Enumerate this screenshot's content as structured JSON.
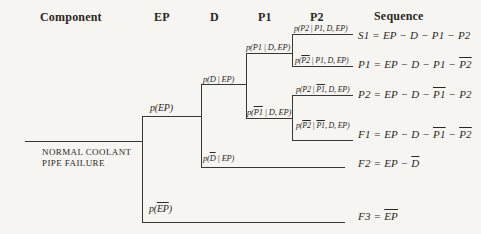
{
  "colors": {
    "background": "#f6f5f1",
    "ink": "#2b2824",
    "line": "#3a3731"
  },
  "headers": {
    "component": "Component",
    "ep": "EP",
    "d": "D",
    "p1": "P1",
    "p2": "P2",
    "sequence": "Sequence"
  },
  "root_event": {
    "line1": "NORMAL COOLANT",
    "line2": "PIPE FAILURE"
  },
  "branch_labels": {
    "ep": [
      {
        "t": "p(EP)"
      }
    ],
    "d": [
      {
        "t": "p(D | EP)"
      }
    ],
    "p1": [
      {
        "t": "p(P1 | D, EP)"
      }
    ],
    "p2_given_p1": [
      {
        "t": "p(P2 | P1, D, EP)"
      }
    ],
    "p2bar_given_p1": [
      {
        "t": "p("
      },
      {
        "t": "P2",
        "o": 1
      },
      {
        "t": " | P1, D, EP)"
      }
    ],
    "p2_given_p1bar": [
      {
        "t": "p(P2 | "
      },
      {
        "t": "P1",
        "o": 1
      },
      {
        "t": ", D, EP)"
      }
    ],
    "p2bar_given_p1bar": [
      {
        "t": "p("
      },
      {
        "t": "P2",
        "o": 1
      },
      {
        "t": " | "
      },
      {
        "t": "P1",
        "o": 1
      },
      {
        "t": ", D, EP)"
      }
    ],
    "p1bar": [
      {
        "t": "p("
      },
      {
        "t": "P1",
        "o": 1
      },
      {
        "t": " | D, EP)"
      }
    ],
    "dbar": [
      {
        "t": "p("
      },
      {
        "t": "D",
        "o": 1
      },
      {
        "t": " | EP)"
      }
    ],
    "epbar": [
      {
        "t": "p("
      },
      {
        "t": "EP",
        "o": 1
      },
      {
        "t": ")"
      }
    ]
  },
  "sequences": {
    "s1": [
      {
        "t": "S1 = EP − D − P1 − P2"
      }
    ],
    "p1": [
      {
        "t": "P1 = EP − D − P1 − "
      },
      {
        "t": "P2",
        "o": 1
      }
    ],
    "p2": [
      {
        "t": "P2 = EP − D − "
      },
      {
        "t": "P1",
        "o": 1
      },
      {
        "t": " − P2"
      }
    ],
    "f1": [
      {
        "t": "F1 = EP − D − "
      },
      {
        "t": "P1",
        "o": 1
      },
      {
        "t": " − "
      },
      {
        "t": "P2",
        "o": 1
      }
    ],
    "f2": [
      {
        "t": "F2 = EP − "
      },
      {
        "t": "D",
        "o": 1
      }
    ],
    "f3": [
      {
        "t": "F3 = "
      },
      {
        "t": "EP",
        "o": 1
      }
    ]
  }
}
